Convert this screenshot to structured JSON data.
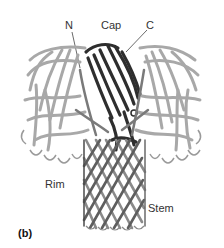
{
  "figure": {
    "panel_label": "(b)",
    "labels": {
      "n_terminus": "N",
      "cap": "Cap",
      "c_terminus": "C",
      "rim": "Rim",
      "stem": "Stem"
    },
    "colors": {
      "background": "#ffffff",
      "light_ribbon": "#a8a8a8",
      "mid_ribbon": "#7a7a7a",
      "dark_ribbon": "#2e2e2e",
      "text": "#333333"
    }
  }
}
